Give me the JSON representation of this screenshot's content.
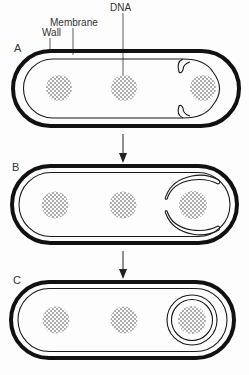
{
  "diagram": {
    "labels": {
      "dna": "DNA",
      "membrane": "Membrane",
      "wall": "Wall"
    },
    "stages": [
      {
        "id": "A",
        "label": "A"
      },
      {
        "id": "B",
        "label": "B"
      },
      {
        "id": "C",
        "label": "C"
      }
    ],
    "colors": {
      "wall": "#111111",
      "membrane": "#1a1a1a",
      "dna_dots": "#333333",
      "background": "#fdfdfd"
    }
  }
}
